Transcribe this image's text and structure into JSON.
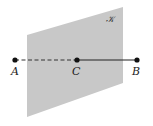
{
  "diagram": {
    "plane": {
      "label": "𝒦",
      "fill": "#c8c8c8",
      "points": "27,35 123,7 123,83 27,117"
    },
    "segment": {
      "hidden_part": "A–C (dashed, behind plane)",
      "visible_part": "C–B (solid, in front of plane)",
      "color": "#222222"
    },
    "points": [
      {
        "name": "A",
        "x": 15,
        "y": 60
      },
      {
        "name": "C",
        "x": 77,
        "y": 60
      },
      {
        "name": "B",
        "x": 137,
        "y": 60
      }
    ]
  }
}
